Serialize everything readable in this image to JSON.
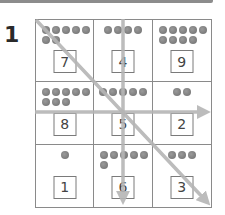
{
  "header": {
    "question_number": "1"
  },
  "grid": {
    "rows": [
      [
        {
          "dots": [
            5,
            2
          ],
          "align": "left",
          "number": "7"
        },
        {
          "dots": [
            4
          ],
          "align": "center",
          "number": "4"
        },
        {
          "dots": [
            5,
            4
          ],
          "align": "left",
          "number": "9"
        }
      ],
      [
        {
          "dots": [
            5,
            3
          ],
          "align": "left",
          "number": "8"
        },
        {
          "dots": [
            5
          ],
          "align": "center",
          "number": "5"
        },
        {
          "dots": [
            2
          ],
          "align": "center",
          "number": "2"
        }
      ],
      [
        {
          "dots": [
            1
          ],
          "align": "center",
          "number": "1"
        },
        {
          "dots": [
            5,
            1
          ],
          "align": "left",
          "number": "6"
        },
        {
          "dots": [
            3
          ],
          "align": "center",
          "number": "3"
        }
      ]
    ]
  },
  "arrows": [
    {
      "name": "diagonal-arrow",
      "from": [
        37,
        21
      ],
      "to": [
        211,
        206
      ]
    },
    {
      "name": "vertical-arrow",
      "from": [
        123,
        19
      ],
      "to": [
        123,
        207
      ]
    },
    {
      "name": "horizontal-arrow",
      "from": [
        35,
        112
      ],
      "to": [
        213,
        112
      ]
    }
  ],
  "colors": {
    "arrow": "#b5b5b5",
    "grid_line": "#8a8a8a",
    "dot": "#7a7a7a",
    "top_bar": "#8c8c8c"
  }
}
